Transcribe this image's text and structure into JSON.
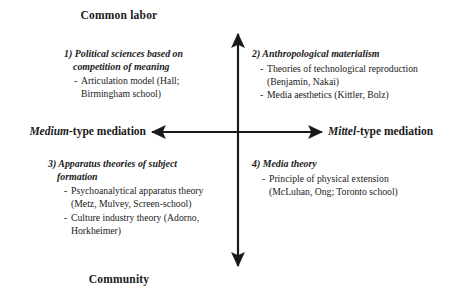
{
  "diagram": {
    "type": "two-axis-quadrant",
    "poles": {
      "top": "Common labor",
      "bottom": "Community",
      "left_italic": "Medium",
      "left_rest": "-type mediation",
      "right_italic": "Mittel",
      "right_rest": "-type mediation"
    },
    "quadrants": [
      {
        "id": "q1",
        "position": "top-left",
        "title_line1": "1) Political sciences based on",
        "title_line2": "competition of meaning",
        "items": [
          "Articulation model (Hall; Birmingham school)"
        ]
      },
      {
        "id": "q2",
        "position": "top-right",
        "title_line1": "2) Anthropological materialism",
        "title_line2": "",
        "items": [
          "Theories of technological reproduction (Benjamin, Nakai)",
          "Media aesthetics (Kittler, Bolz)"
        ]
      },
      {
        "id": "q3",
        "position": "bottom-left",
        "title_line1": "3) Apparatus theories of subject",
        "title_line2": "formation",
        "items": [
          "Psychoanalytical apparatus theory (Metz, Mulvey, Screen-school)",
          "Culture industry theory (Adorno, Horkheimer)"
        ]
      },
      {
        "id": "q4",
        "position": "bottom-right",
        "title_line1": "4) Media theory",
        "title_line2": "",
        "items": [
          "Principle of physical extension (McLuhan, Ong; Toronto school)"
        ]
      }
    ],
    "bullet_glyph": "-",
    "colors": {
      "background": "#ffffff",
      "ink": "#1a1a1a",
      "axis": "#1a1a1a"
    }
  }
}
